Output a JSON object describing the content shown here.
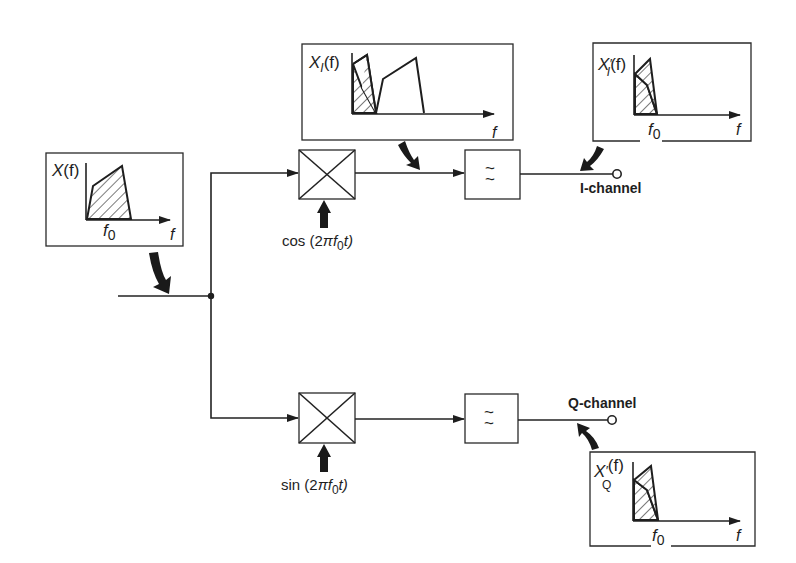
{
  "diagram": {
    "colors": {
      "line": "#222222",
      "background": "#ffffff",
      "hatch": "#333333"
    },
    "input_spectrum": {
      "label": "X(f)",
      "label_main": "X",
      "label_arg": "(f)",
      "center_tick": "f",
      "center_sub": "0",
      "axis": "f"
    },
    "mixed_spectrum": {
      "label": "X_I(f)",
      "label_main": "X",
      "label_sub": "I",
      "label_arg": "(f)",
      "axis": "f"
    },
    "i_out_spectrum": {
      "label": "X'_I(f)",
      "label_main": "X",
      "label_prime": "′",
      "label_sub": "I",
      "label_arg": "(f)",
      "center_tick": "f",
      "center_sub": "0",
      "axis": "f"
    },
    "q_out_spectrum": {
      "label": "X'_Q(f)",
      "label_main": "X",
      "label_prime": "′",
      "label_sub": "Q",
      "label_arg": "(f)",
      "center_tick": "f",
      "center_sub": "0",
      "axis": "f"
    },
    "upper_branch": {
      "mixer": {
        "symbol": "multiplier"
      },
      "oscillator": {
        "prefix": "cos (2",
        "pi": "π",
        "f": "f",
        "sub": "0",
        "suffix": "t)"
      },
      "filter": {
        "symbol_top": "~",
        "symbol_bottom": "~",
        "type": "low-pass"
      },
      "output_label": "I-channel"
    },
    "lower_branch": {
      "mixer": {
        "symbol": "multiplier"
      },
      "oscillator": {
        "prefix": "sin (2",
        "pi": "π",
        "f": "f",
        "sub": "0",
        "suffix": "t)"
      },
      "filter": {
        "symbol_top": "~",
        "symbol_bottom": "~",
        "type": "low-pass"
      },
      "output_label": "Q-channel"
    }
  }
}
